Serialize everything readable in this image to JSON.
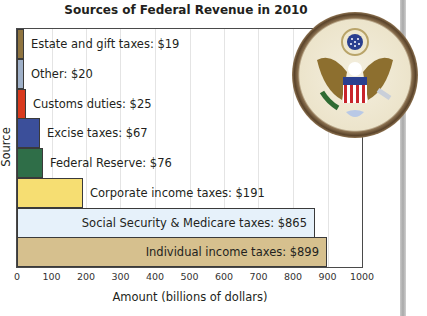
{
  "chart_data": {
    "type": "bar",
    "orientation": "horizontal",
    "title": "Sources of Federal Revenue in 2010",
    "xlabel": "Amount (billions of dollars)",
    "ylabel": "Source",
    "xlim": [
      0,
      1000
    ],
    "xticks": [
      0,
      100,
      200,
      300,
      400,
      500,
      600,
      700,
      800,
      900,
      1000
    ],
    "grid": true,
    "legend": "none",
    "categories": [
      "Estate and gift taxes",
      "Other",
      "Customs duties",
      "Excise taxes",
      "Federal Reserve",
      "Corporate income taxes",
      "Social Security & Medicare taxes",
      "Individual income taxes"
    ],
    "values": [
      19,
      20,
      25,
      67,
      76,
      191,
      865,
      899
    ],
    "labels": [
      "Estate and gift taxes: $19",
      "Other: $20",
      "Customs duties: $25",
      "Excise taxes: $67",
      "Federal Reserve: $76",
      "Corporate income taxes: $191",
      "Social Security & Medicare taxes: $865",
      "Individual income taxes: $899"
    ],
    "colors": [
      "#8f7440",
      "#9fb0c8",
      "#d93a1e",
      "#3b4f9a",
      "#2f6e48",
      "#f6de72",
      "#e6f1fa",
      "#d6c08e"
    ]
  },
  "decoration": {
    "image": "great-seal-of-the-united-states"
  }
}
